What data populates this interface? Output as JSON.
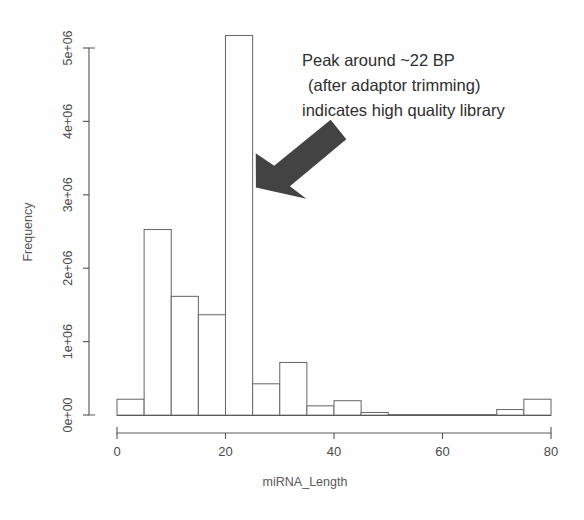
{
  "chart_data": {
    "type": "bar",
    "title": "",
    "subtitle": "",
    "xlabel": "miRNA_Length",
    "ylabel": "Frequency",
    "xlim": [
      0,
      80
    ],
    "ylim": [
      0,
      5400000
    ],
    "grid": false,
    "legend": null,
    "bin_width": 5,
    "x_tick_labels": [
      "0",
      "20",
      "40",
      "60",
      "80"
    ],
    "x_tick_values": [
      0,
      20,
      40,
      60,
      80
    ],
    "y_tick_labels": [
      "0e+00",
      "1e+06",
      "2e+06",
      "3e+06",
      "4e+06",
      "5e+06"
    ],
    "y_tick_values": [
      0,
      1000000,
      2000000,
      3000000,
      4000000,
      5000000
    ],
    "categories": [
      "0-5",
      "5-10",
      "10-15",
      "15-20",
      "20-25",
      "25-30",
      "30-35",
      "35-40",
      "40-45",
      "45-50",
      "50-55",
      "55-60",
      "60-65",
      "65-70",
      "70-75",
      "75-80"
    ],
    "bin_starts": [
      0,
      5,
      10,
      15,
      20,
      25,
      30,
      35,
      40,
      45,
      50,
      55,
      60,
      65,
      70,
      75
    ],
    "values": [
      220000,
      2530000,
      1620000,
      1370000,
      5170000,
      430000,
      720000,
      130000,
      200000,
      40000,
      10000,
      10000,
      10000,
      10000,
      80000,
      220000
    ],
    "annotations": [
      {
        "name": "peak-callout",
        "lines": [
          "Peak around ~22 BP",
          "(after adaptor trimming)",
          "indicates high quality library"
        ],
        "arrow": {
          "name": "callout-arrow",
          "points_to_x": 24,
          "points_to_y": 3250000,
          "direction": "down-left",
          "color": "#434343"
        }
      }
    ],
    "colors": {
      "bar_fill": "#ffffff",
      "bar_stroke": "#6b6b6b",
      "axis": "#5a5a5a",
      "text": "#4a4a4a",
      "annotation": "#2e2e2e",
      "arrow": "#434343",
      "background": "#fefefe"
    }
  },
  "labels": {
    "x_axis_title": "miRNA_Length",
    "y_axis_title": "Frequency",
    "annotation_line_1": "Peak around ~22 BP",
    "annotation_line_2": "(after adaptor trimming)",
    "annotation_line_3": "indicates high quality library",
    "x_tick_0": "0",
    "x_tick_1": "20",
    "x_tick_2": "40",
    "x_tick_3": "60",
    "x_tick_4": "80",
    "y_tick_0": "0e+00",
    "y_tick_1": "1e+06",
    "y_tick_2": "2e+06",
    "y_tick_3": "3e+06",
    "y_tick_4": "4e+06",
    "y_tick_5": "5e+06"
  }
}
